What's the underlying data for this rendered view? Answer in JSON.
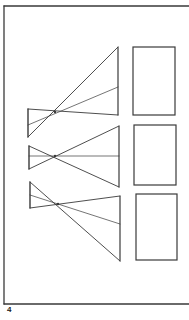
{
  "page": {
    "number": "4",
    "stroke_color": "#3a3a3a",
    "background": "#ffffff"
  },
  "frame": {
    "x1": 4,
    "y1": 6,
    "x2": 189,
    "y2": 304
  },
  "projections": [
    {
      "label": "projection-1",
      "object_left": {
        "x": 28,
        "top": 109,
        "mid": 125,
        "bottom": 137
      },
      "crossing": {
        "x": 55,
        "y": 112
      },
      "image_right": {
        "x": 118,
        "top": 47,
        "mid": 87,
        "bottom": 115
      },
      "screen": {
        "x": 133,
        "y": 47,
        "w": 42,
        "h": 68
      }
    },
    {
      "label": "projection-2",
      "object_left": {
        "x": 29,
        "top": 146,
        "mid": 156,
        "bottom": 169
      },
      "crossing": {
        "x": 55,
        "y": 156
      },
      "image_right": {
        "x": 119,
        "top": 126,
        "mid": 156,
        "bottom": 187
      },
      "screen": {
        "x": 134,
        "y": 125,
        "w": 42,
        "h": 60
      }
    },
    {
      "label": "projection-3",
      "object_left": {
        "x": 30,
        "top": 182,
        "mid": 195,
        "bottom": 208
      },
      "crossing": {
        "x": 58,
        "y": 204
      },
      "image_right": {
        "x": 120,
        "top": 196,
        "mid": 224,
        "bottom": 261
      },
      "screen": {
        "x": 136,
        "y": 194,
        "w": 41,
        "h": 66
      }
    }
  ]
}
